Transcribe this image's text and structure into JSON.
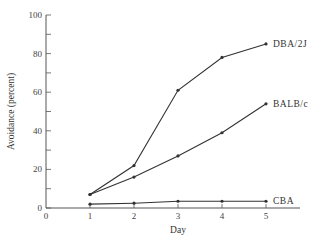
{
  "chart_data": {
    "type": "line",
    "title": "",
    "xlabel": "Day",
    "ylabel": "Avoidance (percent)",
    "x": [
      1,
      2,
      3,
      4,
      5
    ],
    "xticks": [
      0,
      1,
      2,
      3,
      4,
      5
    ],
    "yticks": [
      0,
      20,
      40,
      60,
      80,
      100
    ],
    "xlim": [
      0,
      6
    ],
    "ylim": [
      0,
      100
    ],
    "grid": false,
    "legend_position": "inline-right-end",
    "series": [
      {
        "name": "DBA/2J",
        "values": [
          7,
          22,
          61,
          78,
          85
        ]
      },
      {
        "name": "BALB/c",
        "values": [
          7,
          16,
          27,
          39,
          54
        ]
      },
      {
        "name": "CBA",
        "values": [
          2,
          2.5,
          3.5,
          3.5,
          3.5
        ]
      }
    ]
  },
  "colors": {
    "line": "#333333",
    "axis": "#555555"
  }
}
